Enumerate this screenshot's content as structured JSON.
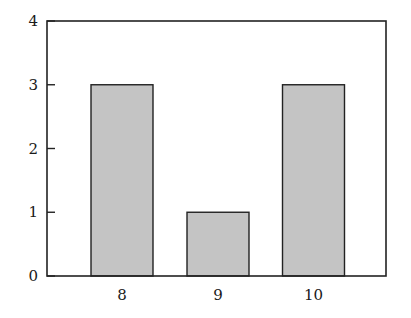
{
  "chart_data": {
    "type": "bar",
    "title": "",
    "xlabel": "",
    "ylabel": "",
    "categories": [
      "8",
      "9",
      "10"
    ],
    "values": [
      3,
      1,
      3
    ],
    "ylim": [
      0,
      4
    ],
    "yticks": [
      "0",
      "1",
      "2",
      "3",
      "4"
    ],
    "grid": false,
    "legend": null,
    "bar_color": "#c4c4c4",
    "bar_edge_color": "#222222",
    "axis_color": "#222222"
  }
}
